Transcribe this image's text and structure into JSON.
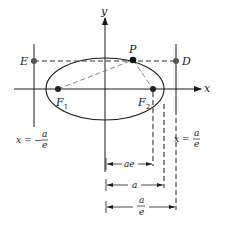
{
  "diagram": {
    "axes": {
      "x_label": "x",
      "y_label": "y"
    },
    "points": {
      "P": "P",
      "E": "E",
      "D": "D",
      "F1": {
        "base": "F",
        "sub": "1"
      },
      "F2": {
        "base": "F",
        "sub": "2"
      }
    },
    "directrices": {
      "left": {
        "prefix": "x = −",
        "num": "a",
        "den": "e"
      },
      "right": {
        "prefix": "x = ",
        "num": "a",
        "den": "e"
      }
    },
    "dimensions": {
      "ae": "ae",
      "a": "a",
      "a_over_e": {
        "num": "a",
        "den": "e"
      }
    },
    "colors": {
      "line": "#1a1a1a",
      "dashed": "#444444",
      "point": "#1a1a1a",
      "background": "#ffffff"
    }
  }
}
